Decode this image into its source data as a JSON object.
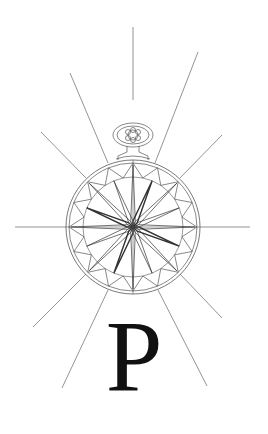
{
  "emblem": {
    "description": "Pocket-watch compass rose emblem with radiating rays",
    "center": [
      133,
      227
    ],
    "outer_radius": 67,
    "inner_ring_radius": 64,
    "star_circle_radius": 50,
    "stroke_color": "#555555",
    "star_stroke_color": "#333333",
    "rays": [
      {
        "x1": 133,
        "y1": 27,
        "x2": 133,
        "y2": 100
      },
      {
        "x1": 198,
        "y1": 52,
        "x2": 155,
        "y2": 163
      },
      {
        "x1": 222,
        "y1": 135,
        "x2": 180,
        "y2": 178
      },
      {
        "x1": 250,
        "y1": 227,
        "x2": 200,
        "y2": 227
      },
      {
        "x1": 15,
        "y1": 227,
        "x2": 66,
        "y2": 227
      },
      {
        "x1": 41,
        "y1": 132,
        "x2": 86,
        "y2": 178
      },
      {
        "x1": 70,
        "y1": 73,
        "x2": 108,
        "y2": 163
      },
      {
        "x1": 33,
        "y1": 327,
        "x2": 86,
        "y2": 274
      },
      {
        "x1": 62,
        "y1": 388,
        "x2": 108,
        "y2": 290
      },
      {
        "x1": 222,
        "y1": 318,
        "x2": 180,
        "y2": 274
      },
      {
        "x1": 207,
        "y1": 386,
        "x2": 158,
        "y2": 290
      }
    ]
  },
  "letter": {
    "text": "P",
    "color": "#111111"
  }
}
